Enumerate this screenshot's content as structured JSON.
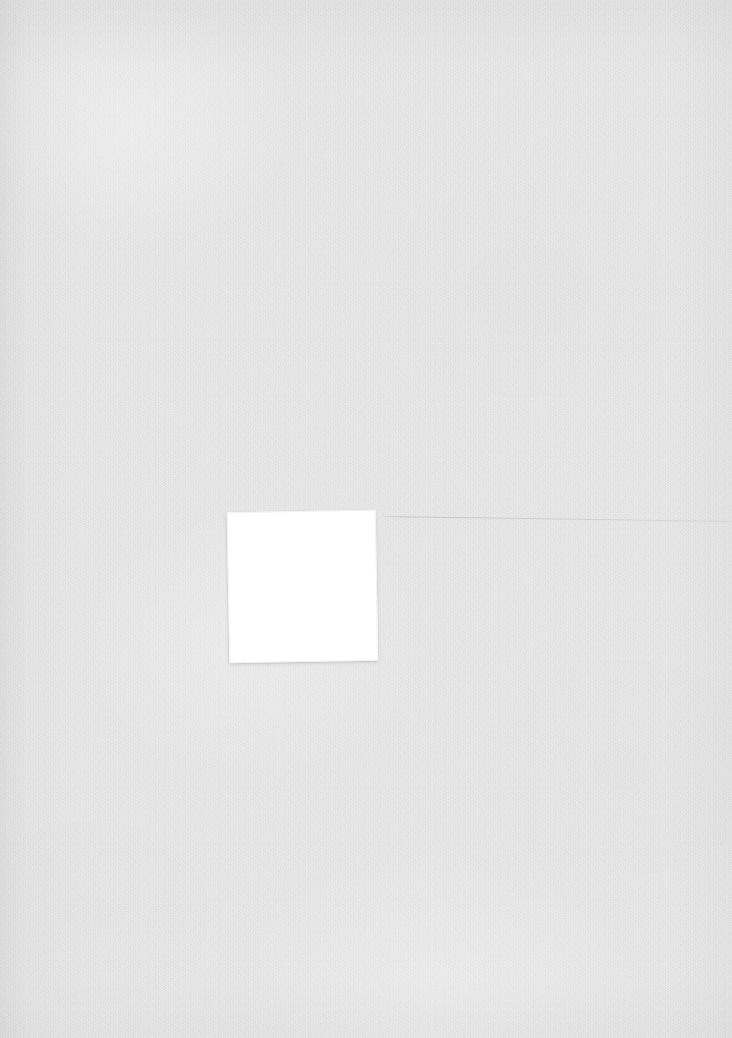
{
  "image": {
    "width": 732,
    "height": 1038,
    "background_color": "#e4e4e4",
    "description_label": "",
    "surface_texture": "paper-grain"
  },
  "square": {
    "label": "",
    "content": "",
    "fill_color": "#ffffff",
    "border_color": "#f2f2f2",
    "left": 228,
    "top": 511,
    "width": 149,
    "height": 151,
    "rotation_degrees": -1
  },
  "hairline": {
    "label": "",
    "color": "#787878",
    "start_x": 377,
    "start_y": 516,
    "end_x": 732,
    "end_y": 521
  }
}
